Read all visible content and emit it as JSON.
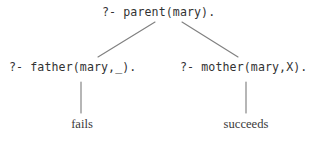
{
  "figure": {
    "kind": "prolog-sld-proof-tree",
    "background_color": "#ffffff",
    "text_color": "#323232",
    "leaf_text_color": "#3a3a3a",
    "edge_color": "#808080"
  },
  "tree": {
    "root": {
      "label": "?- parent(mary)."
    },
    "children": [
      {
        "label": "?- father(mary,_).",
        "outcome": "fails"
      },
      {
        "label": "?- mother(mary,X).",
        "outcome": "succeeds"
      }
    ]
  },
  "edges": [
    {
      "name": "root-to-father",
      "x1": 155,
      "y1": 22,
      "x2": 98,
      "y2": 57
    },
    {
      "name": "root-to-mother",
      "x1": 182,
      "y1": 22,
      "x2": 238,
      "y2": 57
    },
    {
      "name": "father-to-fails",
      "x1": 81,
      "y1": 82,
      "x2": 81,
      "y2": 113
    },
    {
      "name": "mother-to-succeeds",
      "x1": 246,
      "y1": 82,
      "x2": 246,
      "y2": 113
    }
  ]
}
